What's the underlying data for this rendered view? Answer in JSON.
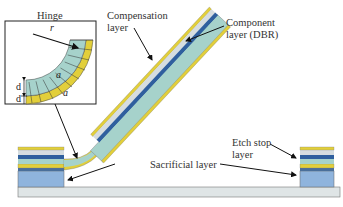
{
  "labels": {
    "hinge": "Hinge",
    "compensation_line1": "Compensation",
    "compensation_line2": "layer",
    "component_line1": "Component",
    "component_line2": "layer (DBR)",
    "sacrificial": "Sacrificial layer",
    "etch_stop_line1": "Etch stop",
    "etch_stop_line2": "layer"
  },
  "inset_symbols": {
    "radius": "r",
    "thickness_top": "d",
    "thickness_bottom": "d",
    "angle_inner": "a",
    "angle_outer": "a"
  },
  "colors": {
    "yellow": "#e2cf3a",
    "light_gray": "#d6dde0",
    "dark_blue": "#2f5f9e",
    "teal": "#a6d2cb",
    "mid_blue": "#8fb4dd",
    "substrate": "#dfe5e6",
    "outline": "#555555"
  }
}
